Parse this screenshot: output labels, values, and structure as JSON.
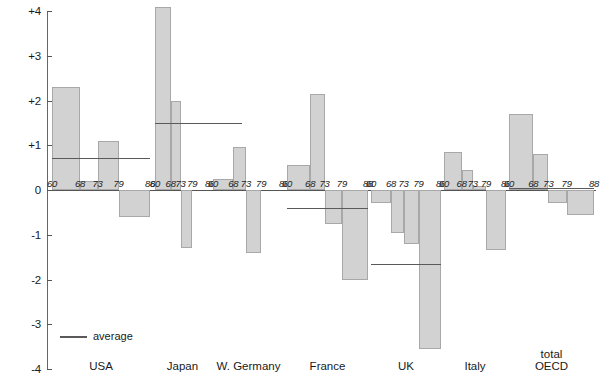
{
  "chart_data": {
    "type": "bar",
    "title": "",
    "xlabel": "",
    "ylabel": "% changes in employment in manufacturing",
    "ylim": [
      -4,
      4
    ],
    "yticks": [
      "+4",
      "+3",
      "+2",
      "+1",
      "0",
      "-1",
      "-2",
      "-3",
      "-4"
    ],
    "ytick_values": [
      4,
      3,
      2,
      1,
      0,
      -1,
      -2,
      -3,
      -4
    ],
    "grid": false,
    "legend_position": "bottom-left",
    "legend": [
      {
        "label": "average",
        "marker": "line",
        "color": "#5a5a5a"
      }
    ],
    "period_labels": [
      "60",
      "68",
      "73",
      "79",
      "88"
    ],
    "groups": [
      {
        "name": "USA",
        "periods": [
          "60-68",
          "68-73",
          "73-79",
          "79-88"
        ],
        "values": [
          2.3,
          0.2,
          1.1,
          -0.6
        ],
        "average": 0.72
      },
      {
        "name": "Japan",
        "periods": [
          "60-68",
          "68-73",
          "73-79",
          "79-88"
        ],
        "values": [
          4.1,
          2.0,
          -1.3,
          0.0
        ],
        "average": 1.5
      },
      {
        "name": "W. Germany",
        "periods": [
          "60-68",
          "68-73",
          "73-79",
          "79-88"
        ],
        "values": [
          0.25,
          0.95,
          -1.4,
          0.0
        ],
        "average": 0.0
      },
      {
        "name": "France",
        "periods": [
          "60-68",
          "68-73",
          "73-79",
          "79-88"
        ],
        "values": [
          0.55,
          2.15,
          -0.75,
          -2.0
        ],
        "average": -0.4
      },
      {
        "name": "UK",
        "periods": [
          "60-68",
          "68-73",
          "73-79",
          "79-88"
        ],
        "values": [
          -0.3,
          -0.95,
          -1.2,
          -3.55
        ],
        "average": -1.65
      },
      {
        "name": "Italy",
        "periods": [
          "60-68",
          "68-73",
          "73-79",
          "79-88"
        ],
        "values": [
          0.85,
          0.45,
          0.1,
          -1.35
        ],
        "average": 0.0
      },
      {
        "name": "total\nOECD",
        "periods": [
          "60-68",
          "68-73",
          "73-79",
          "79-88"
        ],
        "values": [
          1.7,
          0.8,
          -0.3,
          -0.55
        ],
        "average": 0.05
      }
    ],
    "colors": {
      "bar_fill": "#d2d2d2",
      "bar_stroke": "#a8a8a8",
      "axis": "#555555",
      "average_line": "#5a5a5a",
      "text": "#1a1a1a",
      "background": "#ffffff"
    }
  }
}
